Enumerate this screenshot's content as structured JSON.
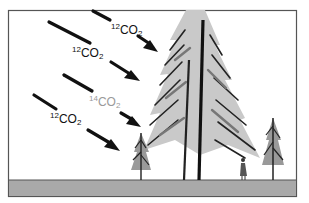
{
  "diagram": {
    "colors": {
      "background": "#ffffff",
      "frame": "#555555",
      "ground": "#a9a9a9",
      "arrow": "#111111",
      "label_12": "#111111",
      "label_14": "#9a9a9a",
      "tree_dark": "#222222",
      "tree_mid": "#888888"
    },
    "arrows": [
      {
        "id": "arrow-1",
        "label": {
          "isotope": "12",
          "molecule": "CO",
          "subscript": "2"
        }
      },
      {
        "id": "arrow-2",
        "label": {
          "isotope": "12",
          "molecule": "CO",
          "subscript": "2"
        }
      },
      {
        "id": "arrow-3",
        "label": {
          "isotope": "14",
          "molecule": "CO",
          "subscript": "2"
        }
      },
      {
        "id": "arrow-4",
        "label": {
          "isotope": "12",
          "molecule": "CO",
          "subscript": "2"
        }
      }
    ],
    "elements": [
      "tall conifer tree",
      "small conifer tree (left)",
      "small conifer tree (right)",
      "human figure",
      "ground strip"
    ]
  }
}
